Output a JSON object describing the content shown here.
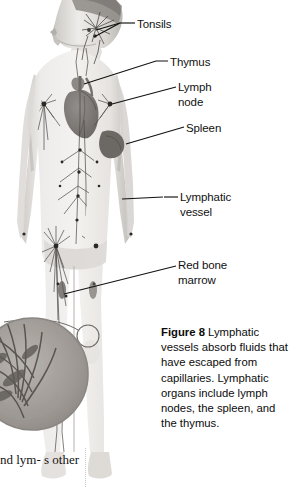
{
  "figure": {
    "alt_name": "lymphatic-system-diagram",
    "labels": [
      {
        "id": "tonsils",
        "text": "Tonsils"
      },
      {
        "id": "thymus",
        "text": "Thymus"
      },
      {
        "id": "lymph_node",
        "text": "Lymph\nnode"
      },
      {
        "id": "spleen",
        "text": "Spleen"
      },
      {
        "id": "lymphatic_vessel",
        "text": "Lymphatic\nvessel"
      },
      {
        "id": "red_bone_marrow",
        "text": "Red bone\nmarrow"
      }
    ]
  },
  "caption": {
    "figure_label": "Figure 8",
    "text": "  Lymphatic vessels absorb fluids that have escaped from capillaries. Lymphatic organs include lymph nodes, the spleen, and the thymus."
  },
  "body_text": {
    "fragment": "nd lym-\ns other"
  },
  "colors": {
    "background": "#ffffff",
    "label_text": "#111111",
    "leader_line": "#111111",
    "body_tone_light": "#e8e6e3",
    "body_tone_mid": "#c9c6c2",
    "body_tone_dark": "#8f8c88",
    "vessel": "#55524f",
    "organ_dark": "#6e6a66"
  }
}
